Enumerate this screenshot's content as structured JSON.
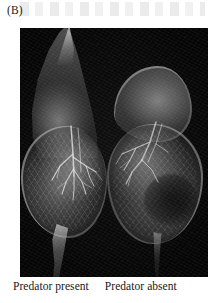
{
  "figure": {
    "panel_label": "(B)",
    "plate": {
      "background_color": "#050505",
      "modality": "scanning-electron-micrograph",
      "subject": "Daphnia"
    },
    "specimens": [
      {
        "id": "predator-present",
        "caption": "Predator present",
        "position": "left",
        "features": [
          "pointed helmet crest",
          "elongated carapace",
          "long curved tail spine",
          "branching filaments"
        ]
      },
      {
        "id": "predator-absent",
        "caption": "Predator absent",
        "position": "right",
        "features": [
          "rounded head without helmet",
          "rounded carapace",
          "short tail spine",
          "dark brood pouch with embryos"
        ]
      }
    ],
    "captions": {
      "left": "Predator present",
      "right": "Predator absent"
    }
  }
}
